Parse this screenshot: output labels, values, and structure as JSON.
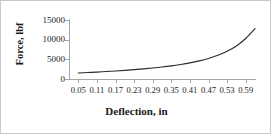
{
  "figure": {
    "border_color": "#c8c8c8",
    "background": "#ffffff"
  },
  "chart_data": {
    "type": "line",
    "title": "",
    "xlabel": "Deflection, in",
    "ylabel": "Force, lbf",
    "xlim": [
      0.02,
      0.62
    ],
    "ylim": [
      0,
      15000
    ],
    "grid": false,
    "legend": null,
    "line_color": "#2b2b2b",
    "axis_color": "#a6a6a6",
    "xticks": [
      0.05,
      0.11,
      0.17,
      0.23,
      0.29,
      0.35,
      0.41,
      0.47,
      0.53,
      0.59
    ],
    "xtick_labels": [
      "0.05",
      "0.11",
      "0.17",
      "0.23",
      "0.29",
      "0.35",
      "0.41",
      "0.47",
      "0.53",
      "0.59"
    ],
    "yticks": [
      0,
      5000,
      10000,
      15000
    ],
    "ytick_labels": [
      "0",
      "5000",
      "10000",
      "15000"
    ],
    "x": [
      0.05,
      0.08,
      0.11,
      0.14,
      0.17,
      0.2,
      0.23,
      0.26,
      0.29,
      0.32,
      0.35,
      0.38,
      0.41,
      0.44,
      0.47,
      0.5,
      0.53,
      0.56,
      0.59,
      0.62
    ],
    "values": [
      1520,
      1640,
      1760,
      1900,
      2040,
      2200,
      2380,
      2570,
      2790,
      3040,
      3330,
      3680,
      4090,
      4600,
      5230,
      6030,
      7050,
      8400,
      10300,
      12800
    ],
    "series": [
      {
        "name": "Force vs Deflection",
        "values": [
          1520,
          1640,
          1760,
          1900,
          2040,
          2200,
          2380,
          2570,
          2790,
          3040,
          3330,
          3680,
          4090,
          4600,
          5230,
          6030,
          7050,
          8400,
          10300,
          12800
        ]
      }
    ]
  }
}
